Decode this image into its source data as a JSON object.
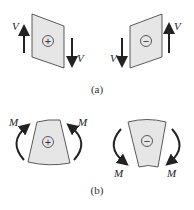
{
  "panels": {
    "a": {
      "caption": "(a)",
      "description": "Shear force sign convention",
      "positive": {
        "sign": "+",
        "force_label_left": "V",
        "force_label_right": "V"
      },
      "negative": {
        "sign": "−",
        "force_label_left": "V",
        "force_label_right": "V"
      }
    },
    "b": {
      "caption": "(b)",
      "description": "Bending moment sign convention",
      "positive": {
        "sign": "+",
        "moment_label_left": "M",
        "moment_label_right": "M"
      },
      "negative": {
        "sign": "−",
        "moment_label_left": "M",
        "moment_label_right": "M"
      }
    }
  },
  "colors": {
    "fill": "#e6e6e6",
    "stroke": "#333333",
    "arrow": "#222222"
  }
}
